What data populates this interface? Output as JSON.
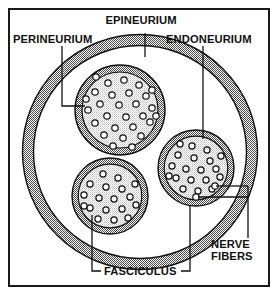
{
  "figure": {
    "frame_color": "#1a1a1a",
    "background_color": "#ffffff",
    "sheath_fill_color": "#8c8c8c",
    "fascicle_fill_color": "#d9d9d9",
    "fiber_fill_color": "#ffffff",
    "outline_color": "#111111",
    "leader_color": "#111111"
  },
  "labels": {
    "epineurium": "EPINEURIUM",
    "perineurium": "PERINEURIUM",
    "endoneurium": "ENDONEURIUM",
    "fasciculus": "FASCICULUS",
    "nerve_fibers_line1": "NERVE",
    "nerve_fibers_line2": "FIBERS"
  },
  "structures": [
    {
      "name": "epineurium",
      "label": "EPINEURIUM",
      "role": "outer connective tissue sheath of the whole nerve",
      "shape": "ring",
      "center": [
        140,
        152
      ],
      "outer_radius": 112,
      "ring_thickness": 11
    },
    {
      "name": "perineurium",
      "label": "PERINEURIUM",
      "role": "sheath surrounding each fasciculus",
      "shape": "ring-around-each-fascicle",
      "ring_thickness": 7
    },
    {
      "name": "endoneurium",
      "label": "ENDONEURIUM",
      "role": "connective tissue between individual nerve fibers",
      "shape": "fascicle-interior-fill"
    },
    {
      "name": "fasciculus",
      "label": "FASCICULUS",
      "role": "bundle of nerve fibers",
      "count": 3
    },
    {
      "name": "nerve-fibers",
      "label": "NERVE FIBERS",
      "role": "individual axons seen in cross-section",
      "shape": "small-circles"
    }
  ],
  "fascicles": [
    {
      "id": "upper-left",
      "center": [
        120,
        110
      ],
      "radius": 45,
      "fiber_count": 28
    },
    {
      "id": "lower-left",
      "center": [
        110,
        196
      ],
      "radius": 38,
      "fiber_count": 18
    },
    {
      "id": "right",
      "center": [
        196,
        168
      ],
      "radius": 38,
      "fiber_count": 21
    }
  ],
  "leaders": [
    {
      "from": "EPINEURIUM",
      "to": "outer-ring",
      "style": "vertical-line"
    },
    {
      "from": "PERINEURIUM",
      "to": "upper-left-fascicle-ring",
      "style": "elbow"
    },
    {
      "from": "ENDONEURIUM",
      "to": "right-fascicle-interior",
      "style": "vertical-line"
    },
    {
      "from": "FASCICULUS",
      "to": "lower-left-fascicle",
      "style": "bracket-left"
    },
    {
      "from": "FASCICULUS",
      "to": "right-fascicle",
      "style": "bracket-right"
    },
    {
      "from": "NERVE FIBERS",
      "to": "right-fascicle-fibers",
      "style": "double-bracket"
    }
  ]
}
